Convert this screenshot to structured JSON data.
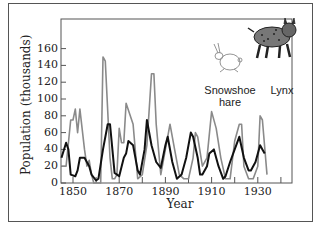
{
  "chart_data": {
    "type": "line",
    "title": "",
    "xlabel": "Year",
    "ylabel": "Population (thousands)",
    "xlim": [
      1845,
      1940
    ],
    "ylim": [
      0,
      160
    ],
    "grid": false,
    "legend_position": "top-right (illustrated)",
    "x_ticks": [
      1850,
      1870,
      1890,
      1910,
      1930
    ],
    "y_ticks": [
      0,
      20,
      40,
      60,
      80,
      100,
      120,
      140,
      160
    ],
    "series": [
      {
        "name": "Snowshoe hare",
        "color": "#8a8a8a",
        "x": [
          1845,
          1847,
          1849,
          1850,
          1851,
          1852,
          1853,
          1855,
          1856,
          1857,
          1858,
          1859,
          1862,
          1863,
          1864,
          1866,
          1867,
          1868,
          1869,
          1870,
          1871,
          1872,
          1873,
          1876,
          1878,
          1880,
          1882,
          1884,
          1885,
          1886,
          1888,
          1890,
          1891,
          1892,
          1894,
          1896,
          1898,
          1900,
          1902,
          1903,
          1904,
          1906,
          1908,
          1910,
          1912,
          1914,
          1916,
          1918,
          1920,
          1922,
          1923,
          1924,
          1926,
          1928,
          1930,
          1931,
          1932,
          1934
        ],
        "values": [
          20,
          20,
          75,
          75,
          88,
          60,
          88,
          40,
          20,
          27,
          10,
          0,
          0,
          150,
          145,
          30,
          5,
          5,
          10,
          65,
          48,
          48,
          95,
          70,
          5,
          10,
          45,
          130,
          130,
          70,
          10,
          40,
          55,
          70,
          40,
          10,
          5,
          5,
          30,
          60,
          55,
          20,
          30,
          85,
          65,
          30,
          5,
          5,
          50,
          70,
          70,
          20,
          5,
          5,
          20,
          80,
          75,
          10
        ]
      },
      {
        "name": "Lynx",
        "color": "#111111",
        "x": [
          1845,
          1847,
          1848,
          1849,
          1851,
          1852,
          1853,
          1855,
          1857,
          1858,
          1860,
          1861,
          1863,
          1865,
          1866,
          1868,
          1870,
          1872,
          1873,
          1874,
          1876,
          1878,
          1879,
          1881,
          1882,
          1884,
          1886,
          1888,
          1890,
          1891,
          1893,
          1895,
          1897,
          1899,
          1901,
          1902,
          1904,
          1905,
          1906,
          1908,
          1909,
          1911,
          1913,
          1915,
          1916,
          1918,
          1920,
          1922,
          1924,
          1926,
          1927,
          1929,
          1931,
          1932,
          1933
        ],
        "values": [
          30,
          48,
          40,
          10,
          8,
          15,
          30,
          30,
          20,
          10,
          3,
          5,
          40,
          70,
          70,
          12,
          8,
          30,
          35,
          50,
          45,
          15,
          10,
          40,
          75,
          45,
          25,
          18,
          45,
          55,
          25,
          5,
          10,
          30,
          60,
          55,
          30,
          10,
          10,
          20,
          35,
          40,
          20,
          5,
          8,
          25,
          40,
          55,
          30,
          15,
          15,
          25,
          45,
          40,
          35
        ]
      }
    ],
    "annotations": [
      "Snowshoe hare",
      "Lynx"
    ]
  },
  "labels": {
    "ylabel": "Population (thousands)",
    "xlabel": "Year",
    "hare_line1": "Snowshoe",
    "hare_line2": "hare",
    "lynx": "Lynx"
  }
}
